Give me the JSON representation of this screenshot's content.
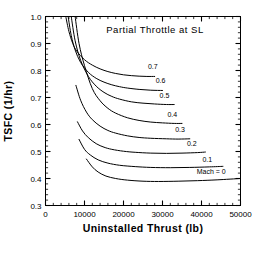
{
  "chart_data": {
    "type": "line",
    "title": "Partial Throttle at SL",
    "xlabel": "Uninstalled Thrust (lb)",
    "ylabel": "TSFC (1/hr)",
    "xlim": [
      0,
      50000
    ],
    "ylim": [
      0.3,
      1.0
    ],
    "xticks": [
      0,
      10000,
      20000,
      30000,
      40000,
      50000
    ],
    "xticklabels": [
      "0",
      "10000",
      "20000",
      "30000",
      "40000",
      "50000"
    ],
    "yticks": [
      0.3,
      0.4,
      0.5,
      0.6,
      0.7,
      0.8,
      0.9,
      1.0
    ],
    "yticklabels": [
      "0.3",
      "0.4",
      "0.5",
      "0.6",
      "0.7",
      "0.8",
      "0.9",
      "1.0"
    ],
    "x_minor_step": 2000,
    "y_minor_step": 0.02,
    "grid": false,
    "legend": "inline-curve-labels",
    "line_color": "#000000",
    "series": [
      {
        "name": "0.7",
        "label": "0.7",
        "label_x": 27500,
        "label_y": 0.805,
        "points": [
          [
            5200,
            1.0
          ],
          [
            6000,
            0.945
          ],
          [
            7000,
            0.9
          ],
          [
            8000,
            0.872
          ],
          [
            10000,
            0.84
          ],
          [
            12000,
            0.82
          ],
          [
            14000,
            0.806
          ],
          [
            16000,
            0.796
          ],
          [
            18000,
            0.789
          ],
          [
            20000,
            0.784
          ],
          [
            22000,
            0.781
          ],
          [
            24000,
            0.779
          ],
          [
            26000,
            0.778
          ],
          [
            28000,
            0.778
          ]
        ]
      },
      {
        "name": "0.6",
        "label": "0.6",
        "label_x": 29500,
        "label_y": 0.752,
        "points": [
          [
            5800,
            1.0
          ],
          [
            6600,
            0.93
          ],
          [
            7600,
            0.876
          ],
          [
            9000,
            0.83
          ],
          [
            11000,
            0.793
          ],
          [
            13000,
            0.771
          ],
          [
            15000,
            0.757
          ],
          [
            17000,
            0.747
          ],
          [
            19000,
            0.74
          ],
          [
            21000,
            0.735
          ],
          [
            24000,
            0.73
          ],
          [
            27000,
            0.727
          ],
          [
            30000,
            0.726
          ]
        ]
      },
      {
        "name": "0.5",
        "label": "0.5",
        "label_x": 30500,
        "label_y": 0.697,
        "points": [
          [
            6600,
            1.0
          ],
          [
            7600,
            0.91
          ],
          [
            9000,
            0.838
          ],
          [
            11000,
            0.778
          ],
          [
            13000,
            0.742
          ],
          [
            15000,
            0.719
          ],
          [
            17000,
            0.704
          ],
          [
            19000,
            0.694
          ],
          [
            22000,
            0.684
          ],
          [
            25000,
            0.679
          ],
          [
            28000,
            0.676
          ],
          [
            31000,
            0.674
          ],
          [
            33000,
            0.674
          ]
        ]
      },
      {
        "name": "0.4",
        "label": "0.4",
        "label_x": 32500,
        "label_y": 0.628,
        "points": [
          [
            7600,
            1.0
          ],
          [
            8600,
            0.9
          ],
          [
            10000,
            0.818
          ],
          [
            12000,
            0.733
          ],
          [
            14000,
            0.688
          ],
          [
            16000,
            0.66
          ],
          [
            18000,
            0.642
          ],
          [
            21000,
            0.625
          ],
          [
            24000,
            0.615
          ],
          [
            27000,
            0.609
          ],
          [
            30000,
            0.606
          ],
          [
            33000,
            0.604
          ],
          [
            35000,
            0.604
          ]
        ]
      },
      {
        "name": "0.3",
        "label": "0.3",
        "label_x": 34500,
        "label_y": 0.572,
        "points": [
          [
            7800,
            0.745
          ],
          [
            9000,
            0.69
          ],
          [
            10500,
            0.646
          ],
          [
            12000,
            0.618
          ],
          [
            14000,
            0.594
          ],
          [
            16000,
            0.578
          ],
          [
            18000,
            0.568
          ],
          [
            21000,
            0.558
          ],
          [
            24000,
            0.552
          ],
          [
            27000,
            0.549
          ],
          [
            31000,
            0.547
          ],
          [
            34000,
            0.546
          ],
          [
            37000,
            0.547
          ]
        ]
      },
      {
        "name": "0.2",
        "label": "0.2",
        "label_x": 37500,
        "label_y": 0.52,
        "points": [
          [
            8200,
            0.61
          ],
          [
            9500,
            0.576
          ],
          [
            11000,
            0.551
          ],
          [
            13000,
            0.529
          ],
          [
            15000,
            0.516
          ],
          [
            17000,
            0.508
          ],
          [
            20000,
            0.501
          ],
          [
            23000,
            0.497
          ],
          [
            27000,
            0.494
          ],
          [
            31000,
            0.493
          ],
          [
            35000,
            0.494
          ],
          [
            39000,
            0.496
          ],
          [
            41000,
            0.498
          ]
        ]
      },
      {
        "name": "0.1",
        "label": "0.1",
        "label_x": 41500,
        "label_y": 0.462,
        "points": [
          [
            8600,
            0.545
          ],
          [
            10000,
            0.508
          ],
          [
            11500,
            0.487
          ],
          [
            13500,
            0.469
          ],
          [
            16000,
            0.457
          ],
          [
            19000,
            0.449
          ],
          [
            23000,
            0.444
          ],
          [
            27000,
            0.441
          ],
          [
            32000,
            0.44
          ],
          [
            37000,
            0.441
          ],
          [
            42000,
            0.443
          ],
          [
            45500,
            0.445
          ]
        ]
      },
      {
        "name": "Mach = 0",
        "label": "Mach = 0",
        "label_x": 42500,
        "label_y": 0.418,
        "points": [
          [
            10500,
            0.472
          ],
          [
            12000,
            0.443
          ],
          [
            13500,
            0.424
          ],
          [
            15500,
            0.409
          ],
          [
            18000,
            0.4
          ],
          [
            21000,
            0.394
          ],
          [
            25000,
            0.39
          ],
          [
            29000,
            0.389
          ],
          [
            34000,
            0.39
          ],
          [
            39000,
            0.392
          ],
          [
            44000,
            0.395
          ],
          [
            50000,
            0.4
          ]
        ]
      }
    ]
  }
}
